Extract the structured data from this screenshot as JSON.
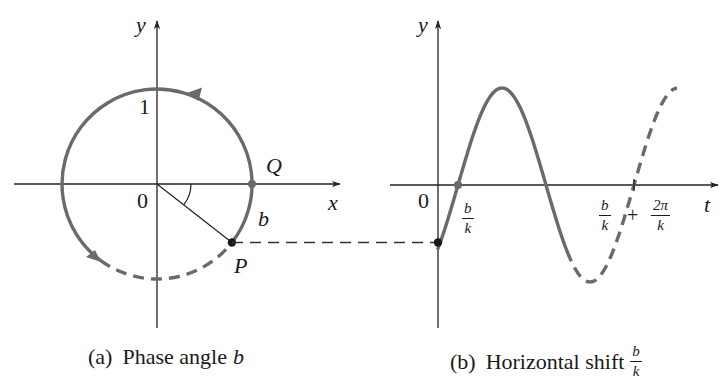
{
  "figure_a": {
    "caption_tag": "(a)",
    "caption_text": "Phase angle",
    "caption_var": "b",
    "axis_x_label": "x",
    "axis_y_label": "y",
    "origin_label": "0",
    "y_tick_label": "1",
    "point_Q_label": "Q",
    "point_P_label": "P",
    "arc_label": "b",
    "circle": {
      "cx": 157,
      "cy": 184,
      "r": 95
    },
    "angle_deg": 38
  },
  "figure_b": {
    "caption_tag": "(b)",
    "caption_text": "Horizontal shift",
    "caption_frac_num": "b",
    "caption_frac_den": "k",
    "axis_t_label": "t",
    "axis_y_label": "y",
    "origin_label": "0",
    "shift_frac_num": "b",
    "shift_frac_den": "k",
    "period_tick_left_num": "b",
    "period_tick_left_den": "k",
    "period_plus": "+",
    "period_tick_right_num": "2π",
    "period_tick_right_den": "k"
  },
  "colors": {
    "curve": "#6a6a6a",
    "axis": "#222222",
    "point": "#1a1a1a",
    "background": "#ffffff"
  }
}
